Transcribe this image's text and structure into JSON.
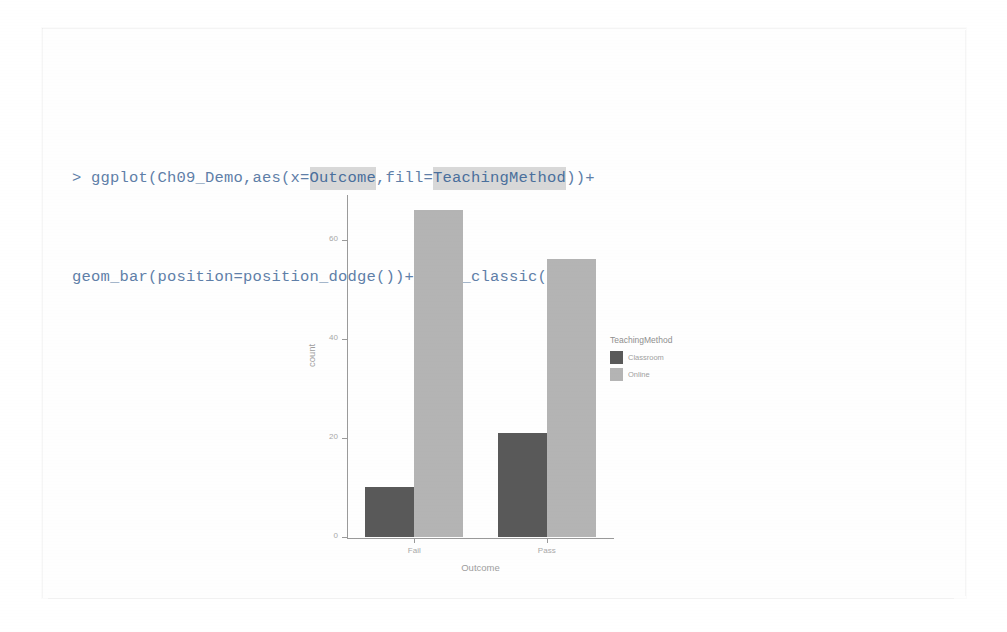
{
  "code_console": {
    "prompt": "> ",
    "line1_pre": "ggplot(Ch09_Demo,aes(x=",
    "line1_hl1": "Outcome",
    "line1_mid": ",fill=",
    "line1_hl2": "TeachingMethod",
    "line1_post": "))+",
    "line2": "geom_bar(position=position_dodge())+theme_classic()",
    "text_color": "#5f7fa8",
    "highlight_color": "#d8d8d8"
  },
  "chart_data": {
    "type": "bar",
    "title": "",
    "subtitle": "",
    "xlabel": "Outcome",
    "ylabel": "count",
    "categories": [
      "Fail",
      "Pass"
    ],
    "series": [
      {
        "name": "Classroom",
        "values": [
          10,
          21
        ],
        "color": "#595959"
      },
      {
        "name": "Online",
        "values": [
          66,
          56
        ],
        "color": "#b4b4b4"
      }
    ],
    "ylim": [
      0,
      69
    ],
    "yticks": [
      0,
      20,
      40,
      60
    ],
    "ytick_labels": [
      "0",
      "20",
      "40",
      "60"
    ],
    "grid": false,
    "legend_title": "TeachingMethod",
    "legend_position": "right",
    "theme": "theme_classic",
    "position": "dodge"
  },
  "colors": {
    "axis": "#9a9a9a",
    "tick_text": "#a8a8a8",
    "axis_title": "#9d9d9d",
    "page_background": "#ffffff"
  }
}
